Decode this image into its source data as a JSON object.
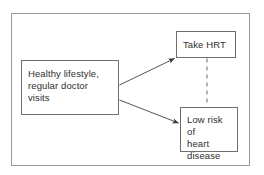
{
  "diagram": {
    "title": "",
    "frame": {
      "stroke": "#9a9a9a"
    },
    "background": "#ffffff",
    "nodes": [
      {
        "id": "lifestyle",
        "label": "Healthy lifestyle,\nregular doctor\nvisits",
        "stroke": "#6e6e6e",
        "fill": "#ffffff",
        "text_color": "#2e2e2e"
      },
      {
        "id": "hrt",
        "label": "Take HRT",
        "stroke": "#6e6e6e",
        "fill": "#ffffff",
        "text_color": "#2e2e2e"
      },
      {
        "id": "lowrisk",
        "label": "Low risk of\nheart\ndisease",
        "stroke": "#6e6e6e",
        "fill": "#ffffff",
        "text_color": "#2e2e2e"
      }
    ],
    "edges": [
      {
        "id": "lifestyle-to-hrt",
        "from": "lifestyle",
        "to": "hrt",
        "style": "solid",
        "arrow": "end",
        "label": "",
        "stroke": "#555555"
      },
      {
        "id": "lifestyle-to-lowrisk",
        "from": "lifestyle",
        "to": "lowrisk",
        "style": "solid",
        "arrow": "end",
        "label": "",
        "stroke": "#555555"
      },
      {
        "id": "hrt-to-lowrisk",
        "from": "hrt",
        "to": "lowrisk",
        "style": "dashed",
        "arrow": "none",
        "label": "",
        "stroke": "#777777"
      }
    ]
  }
}
